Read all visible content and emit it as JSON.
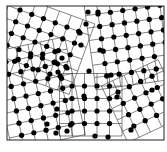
{
  "figure": {
    "caption": "",
    "frame": {
      "x": 7,
      "y": 6,
      "w": 157,
      "h": 134
    },
    "colors": {
      "atom": "#000000",
      "bond": "#333333",
      "frame": "#222222",
      "background": "#ffffff"
    },
    "grains": [
      {
        "name": "top-left",
        "ox": 20,
        "oy": 10,
        "a": 12.5,
        "angle": 20,
        "nx": 6,
        "ny": 5
      },
      {
        "name": "left",
        "ox": 6,
        "oy": 62,
        "a": 12.5,
        "angle": -12,
        "nx": 5,
        "ny": 7
      },
      {
        "name": "top-right",
        "ox": 98,
        "oy": 14,
        "a": 12.5,
        "angle": -8,
        "nx": 6,
        "ny": 6
      },
      {
        "name": "bottom-center",
        "ox": 72,
        "oy": 86,
        "a": 12.5,
        "angle": 0,
        "nx": 4,
        "ny": 4
      },
      {
        "name": "bottom-right",
        "ox": 118,
        "oy": 92,
        "a": 12.5,
        "angle": -25,
        "nx": 4,
        "ny": 4
      }
    ],
    "loose_atoms": [
      [
        88,
        12
      ],
      [
        98,
        12
      ],
      [
        86,
        24
      ],
      [
        80,
        33
      ],
      [
        81,
        45
      ],
      [
        62,
        58
      ],
      [
        55,
        62
      ],
      [
        58,
        72
      ],
      [
        67,
        68
      ],
      [
        89,
        71
      ],
      [
        84,
        96
      ],
      [
        57,
        109
      ],
      [
        47,
        124
      ],
      [
        56,
        133
      ],
      [
        67,
        131
      ],
      [
        95,
        136
      ],
      [
        108,
        137
      ],
      [
        131,
        130
      ],
      [
        117,
        97
      ],
      [
        152,
        90
      ],
      [
        100,
        50
      ],
      [
        111,
        75
      ]
    ]
  }
}
